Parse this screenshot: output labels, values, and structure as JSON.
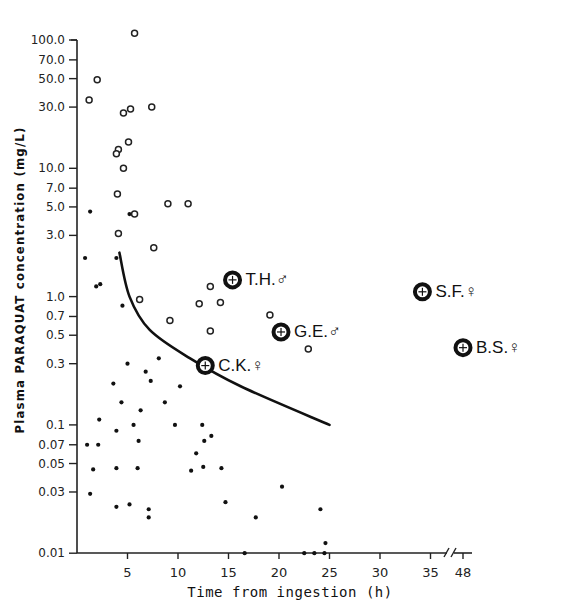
{
  "chart_data": {
    "type": "scatter",
    "title": "",
    "xlabel": "Time from ingestion (h)",
    "ylabel": "Plasma PARAQUAT concentration (mg/L)",
    "yscale": "log",
    "ylim": [
      0.01,
      100
    ],
    "xlim": [
      0,
      48
    ],
    "x_axis_break": "between 35 and 48",
    "grid": false,
    "legend": null,
    "y_ticks": [
      "100.0",
      "70.0",
      "50.0",
      "30.0",
      "10.0",
      "7.0",
      "5.0",
      "3.0",
      "1.0",
      "0.7",
      "0.5",
      "0.3",
      "0.1",
      "0.07",
      "0.05",
      "0.03",
      "0.01"
    ],
    "x_ticks": [
      "5",
      "10",
      "15",
      "20",
      "25",
      "30",
      "35",
      "48"
    ],
    "series": [
      {
        "name": "survivors",
        "marker": "filled-dot",
        "points": [
          [
            0.8,
            2.0
          ],
          [
            1.3,
            4.6
          ],
          [
            1.9,
            1.2
          ],
          [
            2.3,
            1.25
          ],
          [
            3.6,
            0.21
          ],
          [
            3.9,
            2.0
          ],
          [
            4.5,
            0.85
          ],
          [
            5.2,
            4.4
          ],
          [
            5.0,
            0.3
          ],
          [
            6.8,
            0.26
          ],
          [
            7.3,
            0.22
          ],
          [
            8.1,
            0.33
          ],
          [
            8.7,
            0.15
          ],
          [
            9.7,
            0.1
          ],
          [
            10.2,
            0.2
          ],
          [
            6.3,
            0.13
          ],
          [
            4.4,
            0.15
          ],
          [
            2.2,
            0.11
          ],
          [
            1.0,
            0.07
          ],
          [
            2.1,
            0.07
          ],
          [
            3.9,
            0.09
          ],
          [
            5.6,
            0.1
          ],
          [
            6.1,
            0.075
          ],
          [
            1.6,
            0.045
          ],
          [
            3.9,
            0.046
          ],
          [
            6.0,
            0.046
          ],
          [
            1.3,
            0.029
          ],
          [
            3.9,
            0.023
          ],
          [
            5.2,
            0.024
          ],
          [
            7.1,
            0.022
          ],
          [
            7.1,
            0.019
          ],
          [
            11.3,
            0.044
          ],
          [
            11.8,
            0.06
          ],
          [
            12.4,
            0.1
          ],
          [
            12.6,
            0.075
          ],
          [
            13.3,
            0.082
          ],
          [
            12.5,
            0.047
          ],
          [
            14.3,
            0.046
          ],
          [
            14.7,
            0.025
          ],
          [
            17.7,
            0.019
          ],
          [
            20.3,
            0.033
          ],
          [
            24.1,
            0.022
          ],
          [
            24.6,
            0.012
          ],
          [
            16.6,
            0.01
          ],
          [
            22.5,
            0.01
          ],
          [
            23.5,
            0.01
          ],
          [
            24.5,
            0.01
          ]
        ]
      },
      {
        "name": "fatal",
        "marker": "open-circle",
        "points": [
          [
            5.7,
            113
          ],
          [
            2.0,
            49
          ],
          [
            1.2,
            34
          ],
          [
            4.6,
            27
          ],
          [
            5.3,
            29
          ],
          [
            7.4,
            30
          ],
          [
            5.1,
            16
          ],
          [
            4.1,
            14
          ],
          [
            3.9,
            13
          ],
          [
            4.6,
            10
          ],
          [
            4.0,
            6.3
          ],
          [
            5.7,
            4.4
          ],
          [
            9.0,
            5.3
          ],
          [
            11.0,
            5.3
          ],
          [
            4.1,
            3.1
          ],
          [
            7.6,
            2.4
          ],
          [
            6.2,
            0.95
          ],
          [
            9.2,
            0.65
          ],
          [
            13.2,
            1.2
          ],
          [
            12.1,
            0.88
          ],
          [
            14.2,
            0.9
          ],
          [
            13.2,
            0.54
          ],
          [
            19.1,
            0.72
          ],
          [
            22.9,
            0.39
          ]
        ]
      },
      {
        "name": "labeled-patients",
        "marker": "bold-crosshair-circle",
        "points": [
          {
            "label": "T.H.",
            "sex": "male",
            "x": 15.4,
            "y": 1.35
          },
          {
            "label": "G.E.",
            "sex": "male",
            "x": 20.2,
            "y": 0.53
          },
          {
            "label": "C.K.",
            "sex": "female",
            "x": 12.7,
            "y": 0.29
          },
          {
            "label": "S.F.",
            "sex": "female",
            "x": 34.2,
            "y": 1.09
          },
          {
            "label": "B.S.",
            "sex": "female",
            "x": 48,
            "y": 0.4
          }
        ]
      }
    ],
    "curve": {
      "name": "threshold-curve",
      "points": [
        [
          4.2,
          2.2
        ],
        [
          5.2,
          1.0
        ],
        [
          7.2,
          0.55
        ],
        [
          11.2,
          0.33
        ],
        [
          16.2,
          0.2
        ],
        [
          25.0,
          0.1
        ]
      ]
    }
  },
  "labels": {
    "ylabel": "Plasma PARAQUAT concentration (mg/L)",
    "xlabel": "Time from ingestion (h)",
    "male_symbol": "♂",
    "female_symbol": "♀"
  }
}
